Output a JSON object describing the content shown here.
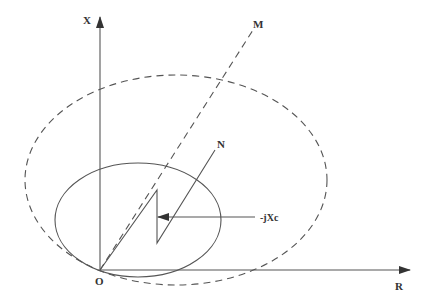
{
  "diagram": {
    "title": "",
    "colors": {
      "stroke": "#555555",
      "text": "#333333",
      "background": "#ffffff"
    },
    "axes": {
      "origin": {
        "label": "O",
        "x": 100,
        "y": 270,
        "label_x": 96,
        "label_y": 284
      },
      "x_axis": {
        "label": "X",
        "x1": 100,
        "y1": 270,
        "x2": 100,
        "y2": 17,
        "label_x": 83,
        "label_y": 24
      },
      "r_axis": {
        "label": "R",
        "x1": 100,
        "y1": 270,
        "x2": 410,
        "y2": 270,
        "label_x": 395,
        "label_y": 290
      }
    },
    "ellipses": [
      {
        "name": "solid-ellipse",
        "style": "solid",
        "cx": 138,
        "cy": 220,
        "rx": 83,
        "ry": 57
      },
      {
        "name": "dashed-ellipse",
        "style": "dashed",
        "cx": 176,
        "cy": 180,
        "rx": 151,
        "ry": 105
      }
    ],
    "lines": {
      "om_line": {
        "style": "dashed",
        "x1": 100,
        "y1": 270,
        "x2": 253,
        "y2": 30,
        "end_label": "M",
        "label_x": 254,
        "label_y": 28
      },
      "zigzag": {
        "points": "100,270 157,190 157,243 215,150",
        "end_label": "N",
        "label_x": 218,
        "label_y": 147
      }
    },
    "annotation": {
      "label": "-jXc",
      "arrow_x1": 255,
      "arrow_y1": 217,
      "arrow_x2": 158,
      "arrow_y2": 217,
      "label_x": 260,
      "label_y": 221
    }
  }
}
